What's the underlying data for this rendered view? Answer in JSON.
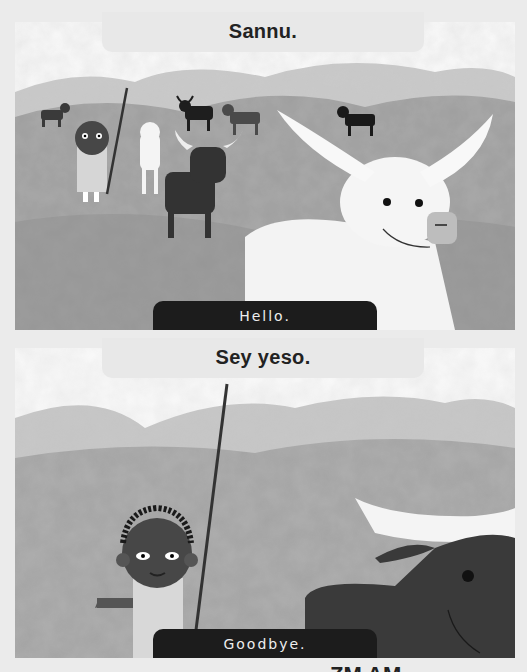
{
  "panels": [
    {
      "title": "Sannu.",
      "caption": "Hello.",
      "illustration": "boy-with-staff-and-cattle-herd"
    },
    {
      "title": "Sey yeso.",
      "caption": "Goodbye.",
      "illustration": "boy-with-staff-and-dark-bull"
    }
  ],
  "footer_fragment": "ZM AM"
}
